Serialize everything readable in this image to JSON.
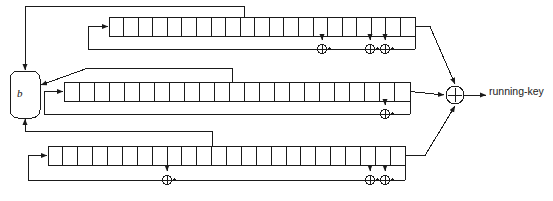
{
  "diagram": {
    "colors": {
      "line": "#1a1a1a",
      "fill": "#ffffff",
      "text": "#1a1a1a"
    },
    "canvas": {
      "width": 553,
      "height": 201
    }
  },
  "control_unit": {
    "label": "b",
    "name": "clock-control-unit",
    "shape": "rounded-rectangle",
    "x": 10,
    "y": 71,
    "w": 30,
    "h": 47,
    "r": 8
  },
  "output": {
    "xor_symbol": "+",
    "label": "running-key",
    "xor_x": 455,
    "xor_y": 95,
    "xor_r": 9
  },
  "registers": [
    {
      "name": "lfsr-top",
      "index": 0,
      "cells": 21,
      "x": 109,
      "y": 17,
      "w": 306,
      "h": 19,
      "cell_w": 14.571,
      "taps": [
        322,
        370,
        385
      ],
      "xor_count": 3,
      "feedback_y": 49,
      "input_arrow_x": 94,
      "input_elbow_x": 88
    },
    {
      "name": "lfsr-middle",
      "index": 1,
      "cells": 23,
      "x": 64,
      "y": 82,
      "w": 346,
      "h": 19,
      "cell_w": 15.043,
      "taps": [
        385
      ],
      "xor_count": 1,
      "feedback_y": 114,
      "input_arrow_x": 50,
      "input_elbow_x": 44
    },
    {
      "name": "lfsr-bottom",
      "index": 2,
      "cells": 24,
      "x": 48,
      "y": 146,
      "w": 357,
      "h": 19,
      "cell_w": 14.875,
      "taps": [
        167,
        370,
        385
      ],
      "xor_count": 3,
      "feedback_y": 180,
      "input_arrow_x": 34,
      "input_elbow_x": 28
    }
  ],
  "clock_lines": [
    {
      "name": "clock-tap-top",
      "from_register": 0,
      "tap_x": 244,
      "to": "b-top"
    },
    {
      "name": "clock-tap-middle",
      "from_register": 1,
      "tap_x": 232,
      "to": "b-right"
    },
    {
      "name": "clock-tap-bottom",
      "from_register": 2,
      "tap_x": 212,
      "to": "b-bottom"
    }
  ]
}
